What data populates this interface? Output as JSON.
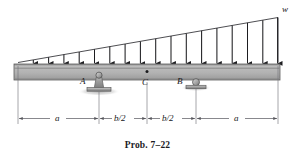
{
  "figure": {
    "caption": "Prob. 7–22",
    "type": "beam-loading-diagram",
    "labels": {
      "load_intensity": "w",
      "support_a": "A",
      "point_c": "C",
      "support_b": "B"
    },
    "dimensions": [
      {
        "label": "a",
        "segment": "left-overhang"
      },
      {
        "label": "b/2",
        "segment": "left-inner"
      },
      {
        "label": "b/2",
        "segment": "right-inner"
      },
      {
        "label": "a",
        "segment": "right-overhang"
      }
    ],
    "supports": [
      {
        "name": "A",
        "kind": "pin"
      },
      {
        "name": "B",
        "kind": "roller"
      }
    ],
    "load": {
      "kind": "triangular-distributed",
      "arrow_count": 17,
      "min_intensity": 0,
      "max_intensity": "w",
      "direction": "downward"
    },
    "colors": {
      "beam_fill": "#b4b4b4",
      "beam_top": "#8e8e8e",
      "beam_edge": "#5c5c5c",
      "line": "#2b2b2e",
      "dim_line": "#6e6e74",
      "support_fill": "#a8a8a8"
    }
  }
}
